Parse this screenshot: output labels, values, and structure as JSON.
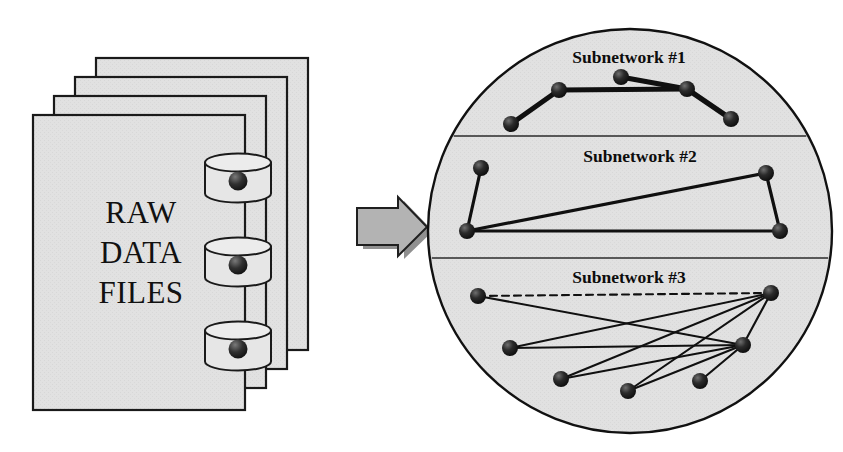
{
  "figure": {
    "background_color": "#ffffff",
    "ink_color": "#111111"
  },
  "left_panel": {
    "name": "raw-data-files-stack",
    "sheet_count": 4,
    "sheet_fill": "#e0e0e0",
    "sheet_border": "#1a1a1a",
    "label_lines": [
      "RAW",
      "DATA",
      "FILES"
    ],
    "label_line_1": "RAW",
    "label_line_2": "DATA",
    "label_line_3": "FILES",
    "databases": [
      {
        "name": "database-cylinder-top",
        "cx": 238,
        "cy": 178
      },
      {
        "name": "database-cylinder-middle",
        "cx": 238,
        "cy": 262
      },
      {
        "name": "database-cylinder-bottom",
        "cx": 238,
        "cy": 346
      }
    ],
    "sheets": [
      {
        "x": 96,
        "y": 58,
        "w": 212,
        "h": 292
      },
      {
        "x": 75,
        "y": 77,
        "w": 212,
        "h": 292
      },
      {
        "x": 54,
        "y": 96,
        "w": 212,
        "h": 292
      },
      {
        "x": 33,
        "y": 115,
        "w": 212,
        "h": 295
      }
    ]
  },
  "arrow": {
    "name": "transform-arrow",
    "direction": "right",
    "fill": "#b3b3b3",
    "stroke": "#1f1f1f",
    "x": 356,
    "y": 200,
    "w": 70,
    "h": 48
  },
  "right_panel": {
    "name": "network-circle",
    "circle": {
      "cx": 630,
      "cy": 231,
      "r": 202,
      "fill": "#e2e2e2",
      "stroke": "#111111"
    },
    "dividers": [
      {
        "name": "divider-1-2",
        "y": 136
      },
      {
        "name": "divider-2-3",
        "y": 258
      }
    ],
    "subnetworks": [
      {
        "id": 1,
        "label": "Subnetwork #1",
        "label_x": 629,
        "label_y": 63,
        "edge_weight": "thick",
        "nodes": [
          {
            "id": "n1",
            "x": 511,
            "y": 124
          },
          {
            "id": "n2",
            "x": 559,
            "y": 90
          },
          {
            "id": "n3",
            "x": 621,
            "y": 77
          },
          {
            "id": "n4",
            "x": 687,
            "y": 89
          },
          {
            "id": "n5",
            "x": 731,
            "y": 119
          }
        ],
        "edges": [
          {
            "from": "n1",
            "to": "n2",
            "style": "solid"
          },
          {
            "from": "n2",
            "to": "n4",
            "style": "solid"
          },
          {
            "from": "n3",
            "to": "n4",
            "style": "solid"
          },
          {
            "from": "n4",
            "to": "n5",
            "style": "solid"
          }
        ]
      },
      {
        "id": 2,
        "label": "Subnetwork #2",
        "label_x": 640,
        "label_y": 162,
        "edge_weight": "medium",
        "nodes": [
          {
            "id": "m1",
            "x": 481,
            "y": 168
          },
          {
            "id": "m2",
            "x": 467,
            "y": 231
          },
          {
            "id": "m3",
            "x": 766,
            "y": 173
          },
          {
            "id": "m4",
            "x": 780,
            "y": 231
          }
        ],
        "edges": [
          {
            "from": "m1",
            "to": "m2",
            "style": "solid"
          },
          {
            "from": "m2",
            "to": "m3",
            "style": "solid"
          },
          {
            "from": "m2",
            "to": "m4",
            "style": "solid"
          },
          {
            "from": "m3",
            "to": "m4",
            "style": "solid"
          }
        ]
      },
      {
        "id": 3,
        "label": "Subnetwork #3",
        "label_x": 629,
        "label_y": 283,
        "edge_weight": "thin",
        "nodes": [
          {
            "id": "p1",
            "x": 478,
            "y": 296
          },
          {
            "id": "p2",
            "x": 510,
            "y": 348
          },
          {
            "id": "p3",
            "x": 561,
            "y": 379
          },
          {
            "id": "p4",
            "x": 628,
            "y": 391
          },
          {
            "id": "p5",
            "x": 700,
            "y": 381
          },
          {
            "id": "p6",
            "x": 771,
            "y": 293
          },
          {
            "id": "p7",
            "x": 743,
            "y": 345
          }
        ],
        "edges": [
          {
            "from": "p1",
            "to": "p6",
            "style": "dashed"
          },
          {
            "from": "p1",
            "to": "p7",
            "style": "solid"
          },
          {
            "from": "p2",
            "to": "p6",
            "style": "solid"
          },
          {
            "from": "p2",
            "to": "p7",
            "style": "solid"
          },
          {
            "from": "p3",
            "to": "p6",
            "style": "solid"
          },
          {
            "from": "p3",
            "to": "p7",
            "style": "solid"
          },
          {
            "from": "p4",
            "to": "p6",
            "style": "solid"
          },
          {
            "from": "p4",
            "to": "p7",
            "style": "solid"
          },
          {
            "from": "p5",
            "to": "p7",
            "style": "solid"
          },
          {
            "from": "p6",
            "to": "p7",
            "style": "solid"
          }
        ]
      }
    ],
    "node_style": {
      "radius": 8,
      "fill": "#1b1b1b",
      "highlight": "#6e6e6e"
    }
  }
}
